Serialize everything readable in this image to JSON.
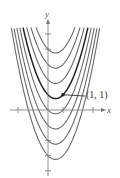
{
  "chart_data": {
    "type": "line",
    "title": "",
    "xlabel": "x",
    "ylabel": "y",
    "xlim": [
      -3.2,
      4.8
    ],
    "ylim": [
      -4.4,
      5.8
    ],
    "grid": false,
    "legend": null,
    "x_ticks": [
      -2,
      1,
      3
    ],
    "y_ticks": [
      -4,
      -3,
      -2,
      4,
      5
    ],
    "series": [
      {
        "name": "C = -3",
        "C": -3,
        "highlight": false
      },
      {
        "name": "C = -2",
        "C": -2,
        "highlight": false
      },
      {
        "name": "C = -1",
        "C": -1,
        "highlight": false
      },
      {
        "name": "C = 0",
        "C": 0,
        "highlight": false
      },
      {
        "name": "C = 1",
        "C": 1,
        "highlight": true
      },
      {
        "name": "C = 2",
        "C": 2,
        "highlight": false
      },
      {
        "name": "C = 3",
        "C": 3,
        "highlight": false
      },
      {
        "name": "C = 4",
        "C": 4,
        "highlight": false
      }
    ],
    "annotations": [
      {
        "text": "(1, 1)",
        "x": 1,
        "y": 1
      }
    ]
  },
  "labels": {
    "x_axis": "x",
    "y_axis": "y",
    "point": "(1, 1)"
  },
  "colors": {
    "curve": "#6a6a6a",
    "highlight": "#222222",
    "axis": "#777777"
  }
}
